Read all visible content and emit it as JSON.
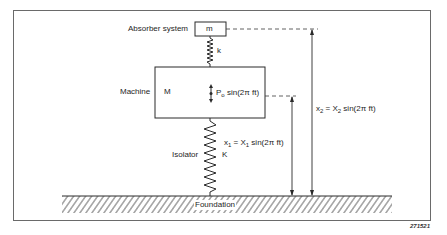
{
  "diagram": {
    "components": {
      "absorber_label": "Absorber system",
      "absorber_mass": "m",
      "absorber_spring": "k",
      "machine_label": "Machine",
      "machine_mass": "M",
      "force_symbol": "P",
      "force_sub": "o",
      "force_expr": " sin(2π ft)",
      "isolator_label": "Isolator",
      "isolator_spring": "K",
      "foundation_label": "Foundation"
    },
    "displacements": {
      "x1": {
        "lhs": "x",
        "lhs_sub": "1",
        "mid": " = X",
        "mid_sub": "1",
        "rhs": " sin(2π ft)"
      },
      "x2": {
        "lhs": "x",
        "lhs_sub": "2",
        "mid": " = X",
        "mid_sub": "2",
        "rhs": " sin(2π ft)"
      }
    },
    "figure_id": "271521",
    "colors": {
      "line": "#2a2a2a",
      "frame": "#6a6a6a",
      "background": "#ffffff"
    }
  }
}
